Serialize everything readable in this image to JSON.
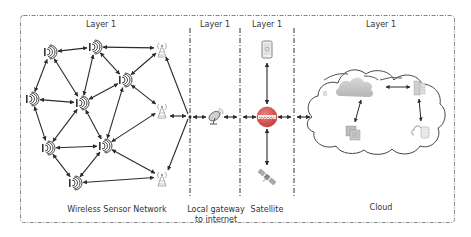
{
  "diagram": {
    "layers": [
      {
        "id": "wsn",
        "header": "Layer 1",
        "caption": [
          "Wireless Sensor Network"
        ]
      },
      {
        "id": "gateway",
        "header": "Layer 1",
        "caption": [
          "Local gateway",
          "to internet"
        ]
      },
      {
        "id": "satellite",
        "header": "Layer 1",
        "caption": [
          "Satellite"
        ]
      },
      {
        "id": "cloud",
        "header": "Layer 1",
        "caption": [
          "Cloud"
        ]
      }
    ],
    "colors": {
      "line": "#2b2b2b",
      "border": "#555555",
      "tower": "#9a9a9a",
      "globe": "#d9534f",
      "cloud_fill": "#e6e6e6",
      "text": "#333333"
    },
    "wsn_nodes": [
      {
        "id": "s1",
        "type": "sensor",
        "x": 50,
        "y": 52
      },
      {
        "id": "s2",
        "type": "sensor",
        "x": 95,
        "y": 47
      },
      {
        "id": "s3",
        "type": "sensor",
        "x": 125,
        "y": 80
      },
      {
        "id": "s4",
        "type": "sensor",
        "x": 32,
        "y": 99
      },
      {
        "id": "s5",
        "type": "sensor",
        "x": 82,
        "y": 103
      },
      {
        "id": "s6",
        "type": "sensor",
        "x": 48,
        "y": 148
      },
      {
        "id": "s7",
        "type": "sensor",
        "x": 105,
        "y": 146
      },
      {
        "id": "s8",
        "type": "sensor",
        "x": 75,
        "y": 183
      },
      {
        "id": "t1",
        "type": "tower",
        "x": 162,
        "y": 48
      },
      {
        "id": "t2",
        "type": "tower",
        "x": 162,
        "y": 109
      },
      {
        "id": "t3",
        "type": "tower",
        "x": 162,
        "y": 177
      }
    ],
    "wsn_links": [
      [
        "s1",
        "s2"
      ],
      [
        "s2",
        "t1"
      ],
      [
        "s1",
        "s4"
      ],
      [
        "s1",
        "s5"
      ],
      [
        "s2",
        "s5"
      ],
      [
        "s2",
        "s3"
      ],
      [
        "s3",
        "t1"
      ],
      [
        "s3",
        "s5"
      ],
      [
        "s3",
        "t2"
      ],
      [
        "s4",
        "s5"
      ],
      [
        "s4",
        "s6"
      ],
      [
        "s5",
        "s6"
      ],
      [
        "s5",
        "s7"
      ],
      [
        "s3",
        "s7"
      ],
      [
        "s7",
        "t2"
      ],
      [
        "s6",
        "s7"
      ],
      [
        "s6",
        "s8"
      ],
      [
        "s7",
        "s8"
      ],
      [
        "s7",
        "t3"
      ],
      [
        "s8",
        "t3"
      ]
    ]
  }
}
